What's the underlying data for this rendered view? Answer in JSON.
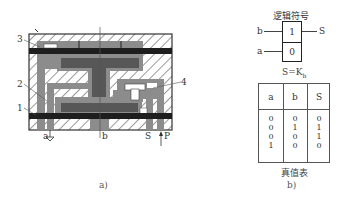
{
  "figure_a": {
    "caption": "a)",
    "part_labels": [
      {
        "id": "3",
        "text": "3"
      },
      {
        "id": "2",
        "text": "2"
      },
      {
        "id": "1",
        "text": "1"
      },
      {
        "id": "4",
        "text": "4"
      }
    ],
    "ports": {
      "a": "a",
      "b": "b",
      "S": "S",
      "P": "P"
    },
    "colors": {
      "body_hatch": "#6f6f6f",
      "channel_fill": "#8c8c8c",
      "membrane_rail": "#1e1e1e",
      "core_dark": "#575757"
    }
  },
  "figure_b": {
    "caption": "b)",
    "symbol_title": "逻辑符号",
    "symbol": {
      "input_top": "b",
      "input_bottom": "a",
      "output": "S",
      "box_top_value": "1",
      "box_bottom_value": "0"
    },
    "equation": "S=K",
    "equation_subscript": "b",
    "truth_table": {
      "title": "真值表",
      "headers": [
        "a",
        "b",
        "S"
      ],
      "rows": [
        [
          "0",
          "0",
          "0"
        ],
        [
          "0",
          "1",
          "1"
        ],
        [
          "0",
          "0",
          "1"
        ],
        [
          "1",
          "0",
          "0"
        ]
      ]
    }
  }
}
